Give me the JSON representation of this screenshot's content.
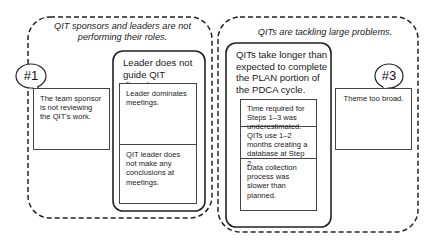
{
  "groups": [
    {
      "title": "QIT sponsors and leaders are not performing their roles.",
      "badge": {
        "label": "#1",
        "text": "The team sponsor is not reviewing the QIT's work."
      },
      "cause": {
        "title": "Leader does not guide QIT direction at meeting.",
        "items": [
          "Leader dominates meetings.",
          "QIT leader does not make any conclusions at meetings."
        ]
      }
    },
    {
      "title": "QITs are tackling large problems.",
      "badge": {
        "label": "#3",
        "text": "Theme too broad."
      },
      "cause": {
        "title": "QITs take longer than expected to complete the PLAN portion of the PDCA cycle.",
        "items": [
          "Time required for Steps 1–3 was underestimated.",
          "QITs use 1–2 months creating a database at Step 2.",
          "Data collection process was slower than planned."
        ]
      }
    }
  ]
}
